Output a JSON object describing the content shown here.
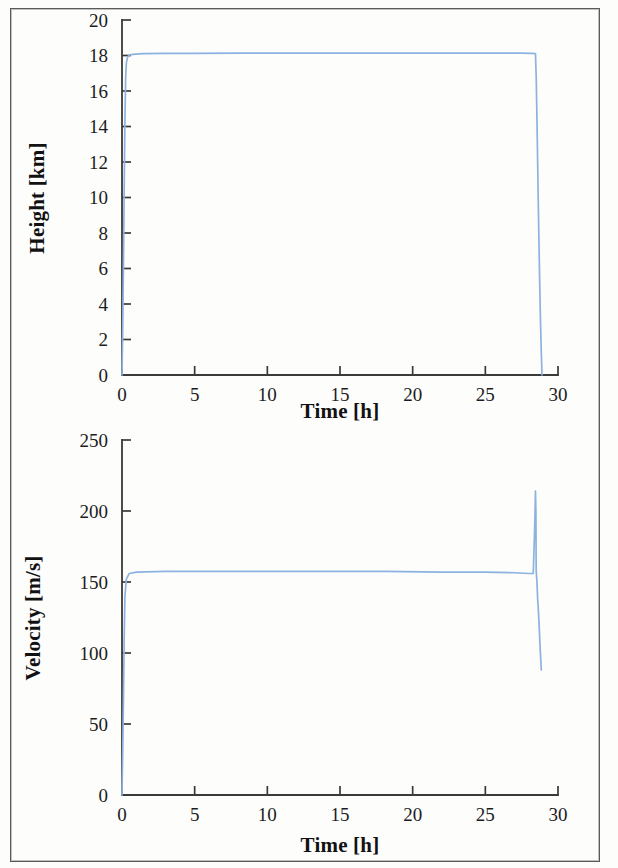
{
  "figure": {
    "background_color": "#fdfdfc",
    "frame_color": "#5a5a58",
    "line_color": "#8cb3e0",
    "axis_color": "#3a3a38",
    "text_color": "#1c1c1c"
  },
  "chart_data": [
    {
      "type": "line",
      "id": "height-vs-time",
      "title": "",
      "xlabel": "Time [h]",
      "ylabel": "Height [km]",
      "xlim": [
        0,
        30
      ],
      "ylim": [
        0,
        20
      ],
      "grid": false,
      "legend": null,
      "xticks": [
        0,
        5,
        10,
        15,
        20,
        25,
        30
      ],
      "xtick_labels": [
        "0",
        "5",
        "10",
        "15",
        "20",
        "25",
        "30"
      ],
      "yticks": [
        0,
        2,
        4,
        6,
        8,
        10,
        12,
        14,
        16,
        18,
        20
      ],
      "ytick_labels": [
        "0",
        "2",
        "4",
        "6",
        "8",
        "10",
        "12",
        "14",
        "16",
        "18",
        "20"
      ],
      "series": [
        {
          "name": "Height",
          "color": "#8cb3e0",
          "x": [
            0.0,
            0.05,
            0.1,
            0.15,
            0.2,
            0.25,
            0.3,
            0.4,
            0.6,
            0.9,
            1.5,
            3.0,
            5.0,
            8.0,
            11.0,
            14.0,
            17.0,
            20.0,
            23.0,
            26.0,
            27.5,
            28.2,
            28.45,
            28.5,
            28.55,
            28.6,
            28.65,
            28.7,
            28.75,
            28.8,
            28.85,
            28.9
          ],
          "y": [
            0.0,
            2.6,
            6.3,
            10.4,
            14.2,
            16.7,
            17.6,
            17.95,
            18.05,
            18.08,
            18.1,
            18.12,
            18.12,
            18.13,
            18.13,
            18.13,
            18.13,
            18.13,
            18.13,
            18.13,
            18.13,
            18.12,
            18.1,
            16.8,
            14.5,
            12.0,
            9.4,
            7.0,
            4.8,
            2.9,
            1.3,
            0.0
          ]
        }
      ]
    },
    {
      "type": "line",
      "id": "velocity-vs-time",
      "title": "",
      "xlabel": "Time [h]",
      "ylabel": "Velocity [m/s]",
      "xlim": [
        0,
        30
      ],
      "ylim": [
        0,
        250
      ],
      "grid": false,
      "legend": null,
      "xticks": [
        0,
        5,
        10,
        15,
        20,
        25,
        30
      ],
      "xtick_labels": [
        "0",
        "5",
        "10",
        "15",
        "20",
        "25",
        "30"
      ],
      "yticks": [
        0,
        50,
        100,
        150,
        200,
        250
      ],
      "ytick_labels": [
        "0",
        "50",
        "100",
        "150",
        "200",
        "250"
      ],
      "series": [
        {
          "name": "Velocity",
          "color": "#8cb3e0",
          "x": [
            0.0,
            0.05,
            0.1,
            0.15,
            0.2,
            0.3,
            0.5,
            1.0,
            3.0,
            6.0,
            10.0,
            14.0,
            18.0,
            22.0,
            25.0,
            27.0,
            28.0,
            28.3,
            28.4,
            28.45,
            28.48,
            28.5,
            28.55,
            28.6,
            28.65,
            28.7,
            28.75,
            28.8,
            28.85
          ],
          "y": [
            0.0,
            30.0,
            68.0,
            110.0,
            140.0,
            152.0,
            156.0,
            157.0,
            157.5,
            157.5,
            157.5,
            157.5,
            157.5,
            157.0,
            157.0,
            156.5,
            156.0,
            156.0,
            190.0,
            214.0,
            200.0,
            158.0,
            150.0,
            138.0,
            130.0,
            120.0,
            108.0,
            98.0,
            88.0
          ]
        }
      ]
    }
  ]
}
